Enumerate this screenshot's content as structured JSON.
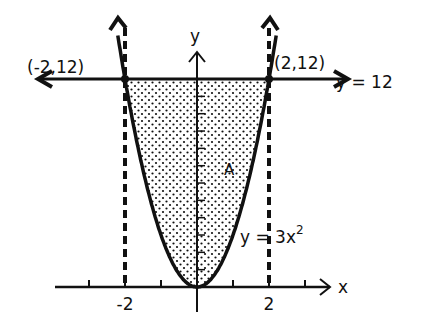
{
  "diagram": {
    "curve_label": "y = 3x",
    "curve_exponent": "2",
    "line_label": "y = 12",
    "region_label": "A",
    "x_axis_label": "x",
    "y_axis_label": "y",
    "left_point_label": "(-2,12)",
    "right_point_label": "(2,12)",
    "x_tick_labels": [
      {
        "value": -2,
        "text": "-2"
      },
      {
        "value": 2,
        "text": "2"
      }
    ],
    "x_ticks": [
      -3,
      -2,
      -1,
      1,
      2,
      3
    ],
    "y_ticks": [
      1,
      2,
      3,
      4,
      5,
      6,
      7,
      8,
      9,
      10,
      11
    ],
    "curve": {
      "a": 3,
      "x_range": [
        -2.2,
        2.2
      ]
    },
    "horizontal_line_y": 12,
    "intersection_x": [
      -2,
      2
    ],
    "colors": {
      "ink": "#111111",
      "background": "#ffffff"
    }
  }
}
